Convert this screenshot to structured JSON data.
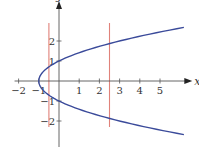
{
  "chart_data": {
    "type": "line",
    "title": "",
    "xlabel": "x",
    "ylabel": "y",
    "xlim": [
      -2.2,
      6.6
    ],
    "ylim": [
      -3.3,
      4.0
    ],
    "grid": false,
    "x_ticks": [
      -2,
      -1,
      1,
      2,
      3,
      4,
      5
    ],
    "x_tick_labels": [
      "−2",
      "−1",
      "1",
      "2",
      "3",
      "4",
      "5"
    ],
    "y_ticks": [
      -2,
      -1,
      1,
      2
    ],
    "y_tick_labels": [
      "−2",
      "−1",
      "1",
      "2"
    ],
    "series": [
      {
        "name": "parabola x = y^2 - 1",
        "equation": "x = y^2 - 1",
        "color": "#3a4a9a",
        "y_range": [
          -2.68,
          2.68
        ]
      }
    ],
    "vertical_lines": [
      {
        "name": "line-left",
        "x": -0.5,
        "y_range": [
          -2.3,
          2.9
        ],
        "color": "#e0827a"
      },
      {
        "name": "line-right",
        "x": 2.5,
        "y_range": [
          -2.3,
          2.9
        ],
        "color": "#e0827a"
      }
    ],
    "axis_color": "#555555"
  }
}
